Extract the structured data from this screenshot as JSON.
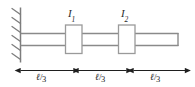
{
  "figure": {
    "colors": {
      "line": "#808080",
      "hatch": "#7a7a7a",
      "dimension": "#1f1f1f",
      "disc_fill": "#ffffff",
      "disc_stroke": "#9a9a9a",
      "text": "#2b2b2b",
      "background": "#ffffff"
    },
    "wall": {
      "name": "fixed-support-wall",
      "hatch_count": 6
    },
    "shaft": {
      "name": "shaft-rod"
    },
    "discs": [
      {
        "id": "disc-1",
        "label_main": "I",
        "label_sub": "1"
      },
      {
        "id": "disc-2",
        "label_main": "I",
        "label_sub": "2"
      }
    ],
    "dimensions": [
      {
        "id": "dimension-1",
        "ell": "ℓ",
        "slash": "/",
        "denominator": "3",
        "text": "ℓ/3"
      },
      {
        "id": "dimension-2",
        "ell": "ℓ",
        "slash": "/",
        "denominator": "3",
        "text": "ℓ/3"
      },
      {
        "id": "dimension-3",
        "ell": "ℓ",
        "slash": "/",
        "denominator": "3",
        "text": "ℓ/3"
      }
    ]
  }
}
